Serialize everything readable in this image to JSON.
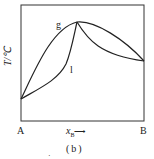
{
  "diagram": {
    "y_axis_label": "T/℃",
    "x_axis_label": "x",
    "x_axis_subscript": "B",
    "x_axis_arrow": "⟶",
    "left_label": "A",
    "right_label": "B",
    "curve_labels": {
      "gas": "g",
      "liquid": "l"
    },
    "caption": "(b)",
    "stray_mark": "·",
    "colors": {
      "line": "#222222",
      "background": "#ffffff"
    }
  }
}
